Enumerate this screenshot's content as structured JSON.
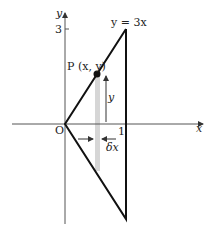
{
  "diagram": {
    "axes": {
      "x_label": "x",
      "y_label": "y",
      "origin_label": "O"
    },
    "ticks": {
      "x_tick": "1",
      "y_tick": "3"
    },
    "curve_label": "y = 3x",
    "point_label": "P (x, y)",
    "height_label": "y",
    "width_label": "δx",
    "colors": {
      "line": "#111111",
      "axis": "#555555",
      "strip": "#d4d4d4"
    }
  }
}
